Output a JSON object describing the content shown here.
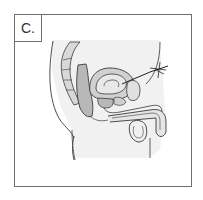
{
  "figure": {
    "panel_label": "C.",
    "colors": {
      "border": "#6e6e6e",
      "outline": "#3a3a3a",
      "fill_gray": "#b8b8b8",
      "fill_light": "#e6e6e6",
      "background": "#ffffff"
    }
  }
}
